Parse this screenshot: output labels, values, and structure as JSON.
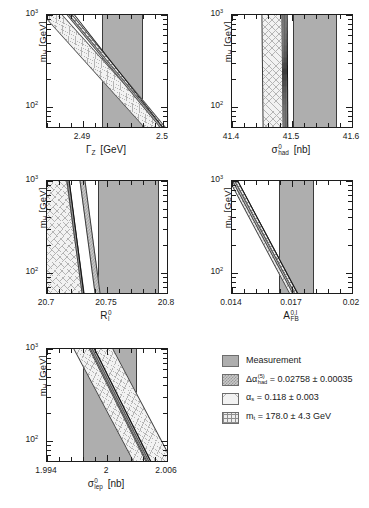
{
  "figure": {
    "background": "#ffffff",
    "y_axis_label": "m_H [GeV]",
    "y_ticks": [
      "10^2",
      "10^3"
    ],
    "colors": {
      "measurement": "#aeaeae",
      "delta_alpha_had": "#c9c9c9",
      "alpha_s": "#f2f2f2",
      "m_t": "#ededed",
      "frame": "#1c1c1c",
      "curve": "#111111"
    }
  },
  "legend": {
    "items": [
      {
        "swatch": "solid-grey-swatch",
        "label": "Measurement",
        "symbol": "",
        "value": ""
      },
      {
        "swatch": "checker-grey-swatch",
        "label": "Δαhad(5) = 0.02758 ± 0.00035",
        "symbol": "Δα",
        "sup": "(5)",
        "sub": "had",
        "value": "= 0.02758 ± 0.00035"
      },
      {
        "swatch": "crosshatch-light-swatch",
        "label": "αs = 0.118 ± 0.003",
        "symbol": "α",
        "sub": "s",
        "value": "= 0.118 ± 0.003"
      },
      {
        "swatch": "grid-hatch-swatch",
        "label": "mt = 178.0 ± 4.3 GeV",
        "symbol": "m",
        "sub": "t",
        "value": "= 178.0 ± 4.3 GeV"
      }
    ]
  },
  "chart_data": [
    {
      "id": "panel-gamma-z",
      "type": "area",
      "title": "",
      "xlabel": "Γ_Z  [GeV]",
      "xlabel_symbol": "Γ",
      "xlabel_sub": "Z",
      "xlabel_unit": "[GeV]",
      "ylabel": "m_H [GeV]",
      "ylabel_symbol": "m",
      "ylabel_sub": "H",
      "ylabel_unit": "[GeV]",
      "xlim": [
        2.4855,
        2.5005
      ],
      "xticks": [
        2.49,
        2.5
      ],
      "xticklabels": [
        "2.49",
        "2.5"
      ],
      "ylim": [
        60,
        1000
      ],
      "yscale": "log",
      "yticks": [
        100,
        1000
      ],
      "yticklabels": [
        "10^2",
        "10^3"
      ],
      "grid": false,
      "measurement_band": {
        "low": 2.4924,
        "high": 2.4975,
        "fill": "measurement"
      },
      "theory_bands": [
        {
          "name": "alpha_s",
          "fill": "alpha_s",
          "x_at_top": 2.4862,
          "x_at_bottom": 2.4988,
          "width_frac": 0.165
        },
        {
          "name": "delta_alpha_had",
          "fill": "delta_alpha_had",
          "x_at_top": 2.4884,
          "x_at_bottom": 2.5,
          "width_frac": 0.052
        },
        {
          "name": "m_t",
          "fill": "m_t",
          "x_at_top": 2.4884,
          "x_at_bottom": 2.5,
          "width_frac": 0.03
        }
      ],
      "central_curve": {
        "x_at_top": 2.4889,
        "x_at_bottom": 2.4999
      }
    },
    {
      "id": "panel-sigma-had",
      "type": "area",
      "xlabel": "σ_had^0 [nb]",
      "xlabel_symbol": "σ",
      "xlabel_sup": "0",
      "xlabel_sub": "had",
      "xlabel_unit": "[nb]",
      "ylabel": "m_H [GeV]",
      "xlim": [
        41.4,
        41.6
      ],
      "xticks": [
        41.4,
        41.5,
        41.6
      ],
      "xticklabels": [
        "41.4",
        "41.5",
        "41.6"
      ],
      "ylim": [
        60,
        1000
      ],
      "yscale": "log",
      "yticks": [
        100,
        1000
      ],
      "yticklabels": [
        "10^2",
        "10^3"
      ],
      "grid": false,
      "measurement_band": {
        "low": 41.502,
        "high": 41.575,
        "fill": "measurement"
      },
      "theory_bands": [
        {
          "name": "alpha_s",
          "fill": "alpha_s",
          "x_at_top": 41.466,
          "x_at_bottom": 41.468,
          "width_frac": 0.175
        },
        {
          "name": "delta_alpha_had",
          "fill": "delta_alpha_had",
          "x_at_top": 41.487,
          "x_at_bottom": 41.489,
          "width_frac": 0.03
        },
        {
          "name": "m_t",
          "fill": "m_t",
          "x_at_top": 41.488,
          "x_at_bottom": 41.49,
          "width_frac": 0.018
        }
      ],
      "central_curve": {
        "x_at_top": 41.4905,
        "x_at_bottom": 41.4915
      }
    },
    {
      "id": "panel-r-l",
      "type": "area",
      "xlabel": "R_l^0",
      "xlabel_symbol": "R",
      "xlabel_sup": "0",
      "xlabel_sub": "l",
      "xlabel_unit": "",
      "ylabel": "m_H [GeV]",
      "xlim": [
        20.7,
        20.8
      ],
      "xticks": [
        20.7,
        20.75,
        20.8
      ],
      "xticklabels": [
        "20.7",
        "20.75",
        "20.8"
      ],
      "ylim": [
        60,
        1000
      ],
      "yscale": "log",
      "yticks": [
        100,
        1000
      ],
      "yticklabels": [
        "10^2",
        "10^3"
      ],
      "grid": false,
      "measurement_band": {
        "low": 20.7425,
        "high": 20.7935,
        "fill": "measurement"
      },
      "theory_bands": [
        {
          "name": "alpha_s",
          "fill": "alpha_s",
          "x_at_top": 20.6985,
          "x_at_bottom": 20.7115,
          "width_frac": 0.355
        },
        {
          "name": "delta_alpha_had",
          "fill": "delta_alpha_had",
          "x_at_top": 20.7295,
          "x_at_bottom": 20.742,
          "width_frac": 0.048
        },
        {
          "name": "m_t",
          "fill": "m_t",
          "x_at_top": 20.7175,
          "x_at_bottom": 20.73,
          "width_frac": 0.026
        }
      ],
      "central_curve": {
        "x_at_top": 20.7185,
        "x_at_bottom": 20.7305
      }
    },
    {
      "id": "panel-afb",
      "type": "area",
      "xlabel": "A_FB^{0,l}",
      "xlabel_symbol": "A",
      "xlabel_sup": "0,l",
      "xlabel_sub": "FB",
      "xlabel_unit": "",
      "ylabel": "m_H [GeV]",
      "xlim": [
        0.014,
        0.02
      ],
      "xticks": [
        0.014,
        0.017,
        0.02
      ],
      "xticklabels": [
        "0.014",
        "0.017",
        "0.02"
      ],
      "ylim": [
        60,
        1000
      ],
      "yscale": "log",
      "yticks": [
        100,
        1000
      ],
      "yticklabels": [
        "10^2",
        "10^3"
      ],
      "grid": false,
      "measurement_band": {
        "low": 0.01634,
        "high": 0.0181,
        "fill": "measurement"
      },
      "theory_bands": [
        {
          "name": "alpha_s",
          "fill": "alpha_s",
          "x_at_top": 0.01402,
          "x_at_bottom": 0.017,
          "width_frac": 0.06
        },
        {
          "name": "delta_alpha_had",
          "fill": "delta_alpha_had",
          "x_at_top": 0.01412,
          "x_at_bottom": 0.01712,
          "width_frac": 0.046
        },
        {
          "name": "m_t",
          "fill": "m_t",
          "x_at_top": 0.01418,
          "x_at_bottom": 0.01716,
          "width_frac": 0.03
        }
      ],
      "central_curve": {
        "x_at_top": 0.01424,
        "x_at_bottom": 0.01722
      }
    },
    {
      "id": "panel-sigma-lep",
      "type": "area",
      "xlabel": "σ_lep^0  [nb]",
      "xlabel_symbol": "σ",
      "xlabel_sup": "0",
      "xlabel_sub": "lep",
      "xlabel_unit": "[nb]",
      "ylabel": "m_H [GeV]",
      "xlim": [
        1.994,
        2.006
      ],
      "xticks": [
        1.994,
        2.0,
        2.006
      ],
      "xticklabels": [
        "1.994",
        "2",
        "2.006"
      ],
      "ylim": [
        60,
        1000
      ],
      "yscale": "log",
      "yticks": [
        100,
        1000
      ],
      "yticklabels": [
        "10^2",
        "10^3"
      ],
      "grid": false,
      "measurement_band": {
        "low": 1.99755,
        "high": 2.00295,
        "fill": "measurement"
      },
      "theory_bands": [
        {
          "name": "alpha_s",
          "fill": "alpha_s",
          "x_at_top": 1.99862,
          "x_at_bottom": 2.00455,
          "width_frac": 0.33
        },
        {
          "name": "delta_alpha_had",
          "fill": "delta_alpha_had",
          "x_at_top": 1.99842,
          "x_at_bottom": 2.00405,
          "width_frac": 0.046
        },
        {
          "name": "m_t",
          "fill": "m_t",
          "x_at_top": 1.99848,
          "x_at_bottom": 2.0041,
          "width_frac": 0.026
        }
      ],
      "central_curve": {
        "x_at_top": 1.99872,
        "x_at_bottom": 2.0043
      }
    }
  ]
}
